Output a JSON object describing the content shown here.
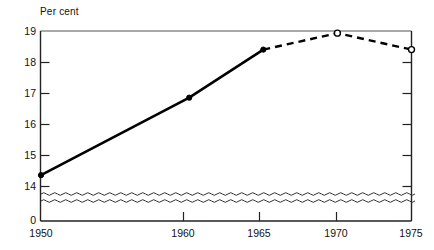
{
  "chart_data": {
    "type": "line",
    "title": "",
    "subtitle": "",
    "ylabel": "Per cent",
    "xlabel": "",
    "ylim": [
      14,
      19
    ],
    "xlim": [
      1950,
      1975
    ],
    "ytick_labels": [
      "19",
      "18",
      "17",
      "16",
      "15",
      "14"
    ],
    "ytick_values": [
      19,
      18,
      17,
      16,
      15,
      14
    ],
    "yzero_label": "0",
    "xtick_labels": [
      "1950",
      "1960",
      "1965",
      "1970",
      "1975"
    ],
    "xtick_values": [
      1950,
      1960,
      1965,
      1970,
      1975
    ],
    "grid": false,
    "legend": "none",
    "axis_break": "wavy-break between 0 and 14 on value axis",
    "series": [
      {
        "name": "actual",
        "style": "solid",
        "marker": "filled-circle",
        "x": [
          1950,
          1960,
          1965
        ],
        "values": [
          14.35,
          16.85,
          18.4
        ]
      },
      {
        "name": "projected",
        "style": "dashed",
        "marker": "open-circle",
        "x": [
          1965,
          1970,
          1975
        ],
        "values": [
          18.4,
          18.93,
          18.4
        ]
      }
    ],
    "annotations": [],
    "colors": {
      "line": "#000000",
      "axis": "#2b2b2b",
      "background": "#ffffff"
    }
  },
  "labels": {
    "units": "Per cent"
  }
}
